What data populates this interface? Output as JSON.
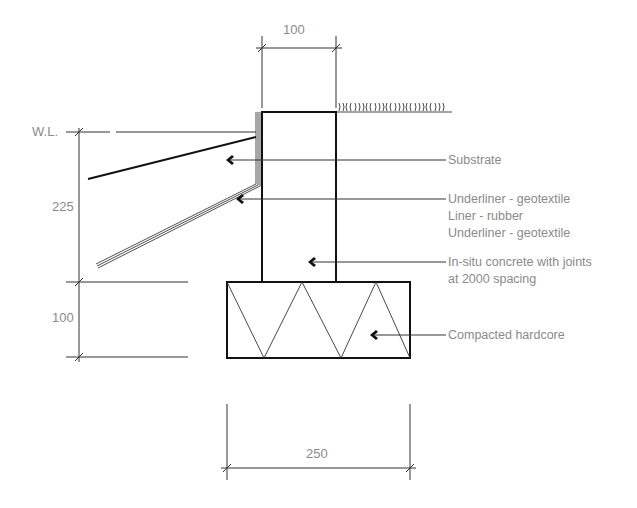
{
  "diagram": {
    "type": "construction-section",
    "dimensions": {
      "wall_width": "100",
      "water_depth": "225",
      "footing_depth": "100",
      "footing_width": "250"
    },
    "water_level_label": "W.L.",
    "labels": {
      "substrate": "Substrate",
      "underliner_top": "Underliner - geotextile",
      "liner": "Liner - rubber",
      "underliner_bottom": "Underliner - geotextile",
      "concrete_line1": "In-situ concrete with joints",
      "concrete_line2": "at 2000 spacing",
      "hardcore": "Compacted hardcore"
    },
    "colors": {
      "linework": "#1a1a1a",
      "annotation": "#8a8a8a",
      "background": "#ffffff"
    }
  }
}
